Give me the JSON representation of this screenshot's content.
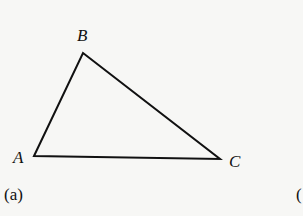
{
  "figure": {
    "caption": "(a)",
    "next_caption_partial": "(",
    "triangle": {
      "vertices": {
        "A": {
          "label": "A",
          "x": 34,
          "y": 156
        },
        "B": {
          "label": "B",
          "x": 83,
          "y": 53
        },
        "C": {
          "label": "C",
          "x": 220,
          "y": 159
        }
      },
      "stroke_color": "#111111",
      "stroke_width": 2
    }
  }
}
